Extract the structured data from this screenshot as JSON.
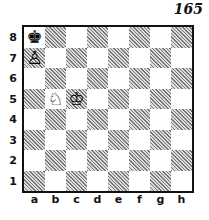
{
  "diagram_number": "165",
  "ranks": [
    "8",
    "7",
    "6",
    "5",
    "4",
    "3",
    "2",
    "1"
  ],
  "files": [
    "a",
    "b",
    "c",
    "d",
    "e",
    "f",
    "g",
    "h"
  ],
  "pieces": {
    "a8": {
      "glyph": "♚",
      "name": "black-king"
    },
    "a7": {
      "glyph": "♙",
      "name": "white-pawn"
    },
    "b5": {
      "glyph": "♘",
      "name": "white-knight"
    },
    "c5": {
      "glyph": "♔",
      "name": "white-king"
    }
  }
}
